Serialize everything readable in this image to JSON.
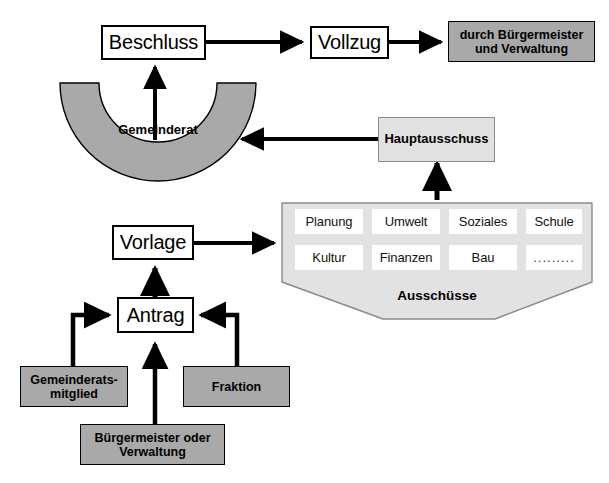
{
  "diagram": {
    "colors": {
      "dark_gray_fill": "#a9a9a9",
      "light_gray_fill": "#e2e2e2",
      "white_fill": "#ffffff",
      "outline": "#000000",
      "soft_outline": "#8a8a8a",
      "background": "#ffffff"
    },
    "nodes": {
      "beschluss": {
        "label": "Beschluss",
        "style": "white-box"
      },
      "vollzug": {
        "label": "Vollzug",
        "style": "white-box"
      },
      "durch_buergermeister": {
        "label": "durch Bürgermeister\nund Verwaltung",
        "line1": "durch Bürgermeister",
        "line2": "und Verwaltung",
        "style": "gray-box"
      },
      "gemeinderat": {
        "label": "Gemeinderat",
        "style": "half-donut"
      },
      "hauptausschuss": {
        "label": "Hauptausschuss",
        "style": "light-gray-box"
      },
      "ausschuesse": {
        "label": "Ausschüsse",
        "style": "pentagon-container"
      },
      "vorlage": {
        "label": "Vorlage",
        "style": "white-box"
      },
      "antrag": {
        "label": "Antrag",
        "style": "white-box"
      },
      "gemeinderatsmitglied": {
        "label": "Gemeinderats-\nmitglied",
        "line1": "Gemeinderats-",
        "line2": "mitglied",
        "style": "gray-box"
      },
      "buergermeister_oder_verwaltung": {
        "label": "Bürgermeister oder\nVerwaltung",
        "line1": "Bürgermeister oder",
        "line2": "Verwaltung",
        "style": "gray-box"
      },
      "fraktion": {
        "label": "Fraktion",
        "style": "gray-box"
      }
    },
    "ausschuesse_items": [
      {
        "label": "Planung"
      },
      {
        "label": "Umwelt"
      },
      {
        "label": "Soziales"
      },
      {
        "label": "Schule"
      },
      {
        "label": "Kultur"
      },
      {
        "label": "Finanzen"
      },
      {
        "label": "Bau"
      },
      {
        "label": "........."
      }
    ],
    "edges": [
      {
        "from": "beschluss",
        "to": "vollzug",
        "direction": "right"
      },
      {
        "from": "vollzug",
        "to": "durch_buergermeister",
        "direction": "right"
      },
      {
        "from": "gemeinderat",
        "to": "beschluss",
        "direction": "up"
      },
      {
        "from": "hauptausschuss",
        "to": "gemeinderat",
        "direction": "left"
      },
      {
        "from": "ausschuesse",
        "to": "hauptausschuss",
        "direction": "up"
      },
      {
        "from": "vorlage",
        "to": "ausschuesse",
        "direction": "right"
      },
      {
        "from": "antrag",
        "to": "vorlage",
        "direction": "up"
      },
      {
        "from": "gemeinderatsmitglied",
        "to": "antrag",
        "direction": "up-right"
      },
      {
        "from": "buergermeister_oder_verwaltung",
        "to": "antrag",
        "direction": "up"
      },
      {
        "from": "fraktion",
        "to": "antrag",
        "direction": "up-left"
      }
    ]
  }
}
